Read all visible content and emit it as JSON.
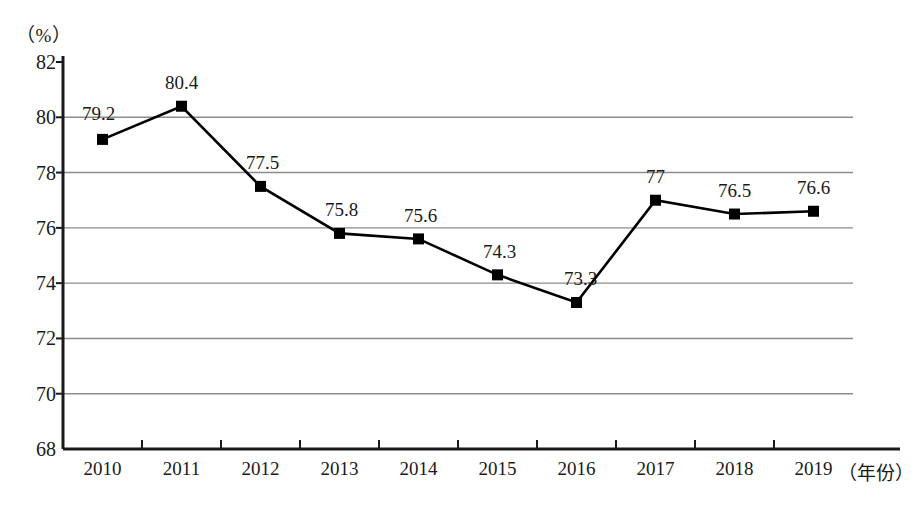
{
  "chart_data": {
    "type": "line",
    "title": "",
    "subtitle": "",
    "xlabel": "（年份）",
    "ylabel": "（%）",
    "unit_label": "（%）",
    "categories": [
      "2010",
      "2011",
      "2012",
      "2013",
      "2014",
      "2015",
      "2016",
      "2017",
      "2018",
      "2019"
    ],
    "values": [
      79.2,
      80.4,
      77.5,
      75.8,
      75.6,
      74.3,
      73.3,
      77,
      76.5,
      76.6
    ],
    "point_labels": [
      "79.2",
      "80.4",
      "77.5",
      "75.8",
      "75.6",
      "74.3",
      "73.3",
      "77",
      "76.5",
      "76.6"
    ],
    "ylim": [
      68,
      82
    ],
    "yticks": [
      82,
      80,
      78,
      76,
      74,
      72,
      70,
      68
    ],
    "ytick_labels": [
      "82",
      "80",
      "78",
      "76",
      "74",
      "72",
      "70",
      "68"
    ],
    "grid": true,
    "grid_axis": "y",
    "legend": "none",
    "series": [
      {
        "name": "",
        "values": [
          79.2,
          80.4,
          77.5,
          75.8,
          75.6,
          74.3,
          73.3,
          77,
          76.5,
          76.6
        ],
        "marker": "square",
        "marker_color": "#000000",
        "line_color": "#000000"
      }
    ],
    "colors": {
      "line": "#000000",
      "marker": "#000000",
      "axis": "#1a1a1a",
      "grid": "#8c8c8c",
      "text": "#1a1a1a",
      "background": "#ffffff"
    }
  },
  "caption": {
    "text": "",
    "visible": false
  }
}
